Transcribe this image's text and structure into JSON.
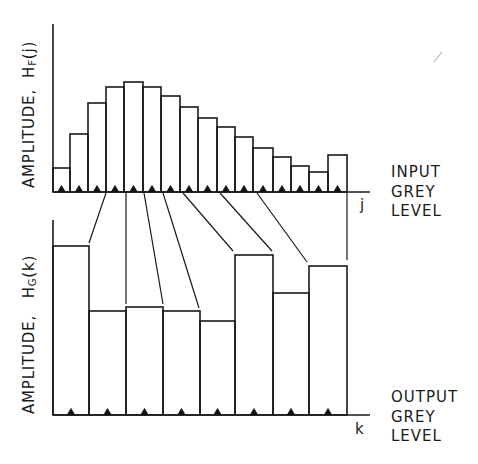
{
  "figure": {
    "top_histogram": {
      "y_axis_label_prefix": "AMPLITUDE,",
      "y_axis_label_symbol": "H",
      "y_axis_label_subscript": "F",
      "y_axis_label_arg": "(j)",
      "x_axis_variable": "j",
      "x_axis_label_lines": [
        "INPUT",
        "GREY",
        "LEVEL"
      ]
    },
    "bottom_histogram": {
      "y_axis_label_prefix": "AMPLITUDE,",
      "y_axis_label_symbol": "H",
      "y_axis_label_subscript": "G",
      "y_axis_label_arg": "(k)",
      "x_axis_variable": "k",
      "x_axis_label_lines": [
        "OUTPUT",
        "GREY",
        "LEVEL"
      ]
    },
    "colors": {
      "line": "#1a1a1a",
      "background": "#ffffff",
      "marker": "#111111"
    }
  },
  "chart_data": [
    {
      "type": "bar",
      "title": "Input histogram",
      "xlabel": "INPUT GREY LEVEL (j)",
      "ylabel": "AMPLITUDE, H_F(j)",
      "bin_edges_px": [
        53,
        70,
        88,
        106,
        124,
        143,
        161,
        180,
        198,
        217,
        235,
        253,
        273,
        291,
        309,
        328,
        347
      ],
      "top_px": [
        168,
        134,
        103,
        87,
        82,
        87,
        96,
        107,
        118,
        127,
        137,
        148,
        157,
        166,
        172,
        155
      ],
      "baseline_px": 192,
      "categories": [
        "1",
        "2",
        "3",
        "4",
        "5",
        "6",
        "7",
        "8",
        "9",
        "10",
        "11",
        "12",
        "13",
        "14",
        "15",
        "16"
      ],
      "values": [
        24,
        58,
        89,
        105,
        110,
        105,
        96,
        85,
        74,
        65,
        55,
        44,
        35,
        26,
        20,
        37
      ]
    },
    {
      "type": "bar",
      "title": "Output histogram",
      "xlabel": "OUTPUT GREY LEVEL (k)",
      "ylabel": "AMPLITUDE, H_G(k)",
      "bin_edges_px": [
        53,
        89,
        126,
        163,
        200,
        235,
        273,
        309,
        347
      ],
      "top_px": [
        246,
        311,
        307,
        311,
        321,
        255,
        293,
        266
      ],
      "baseline_px": 415,
      "categories": [
        "1",
        "2",
        "3",
        "4",
        "5",
        "6",
        "7",
        "8"
      ],
      "values": [
        169,
        104,
        108,
        104,
        94,
        160,
        122,
        149
      ]
    }
  ],
  "mapping_lines": [
    {
      "from": [
        106,
        193
      ],
      "to": [
        89,
        243
      ]
    },
    {
      "from": [
        126,
        193
      ],
      "to": [
        126,
        304
      ]
    },
    {
      "from": [
        144,
        193
      ],
      "to": [
        163,
        304
      ]
    },
    {
      "from": [
        163,
        193
      ],
      "to": [
        199,
        308
      ]
    },
    {
      "from": [
        183,
        193
      ],
      "to": [
        233,
        251
      ]
    },
    {
      "from": [
        220,
        193
      ],
      "to": [
        272,
        251
      ]
    },
    {
      "from": [
        257,
        193
      ],
      "to": [
        307,
        262
      ]
    },
    {
      "from": [
        347,
        193
      ],
      "to": [
        347,
        260
      ]
    }
  ]
}
